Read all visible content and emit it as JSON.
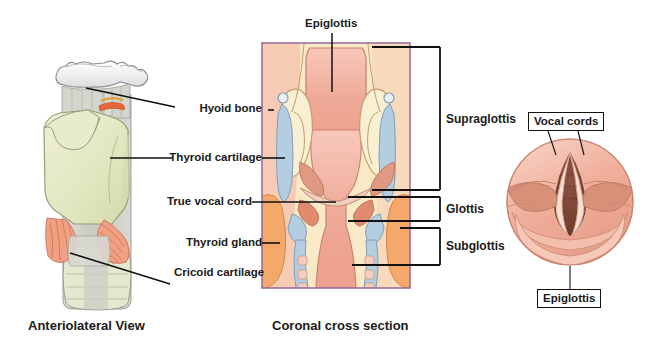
{
  "figure": {
    "title_top_label": "Epiglottis",
    "captions": {
      "left": "Anteriolateral View",
      "middle": "Coronal cross section"
    }
  },
  "anterolateral_view": {
    "labels": [
      {
        "text": "Hyoid bone"
      },
      {
        "text": "Thyroid cartilage"
      },
      {
        "text": "True vocal cord"
      },
      {
        "text": "Thyroid gland"
      },
      {
        "text": "Cricoid cartilage"
      }
    ]
  },
  "coronal_view": {
    "top_label": "Epiglottis",
    "region_labels": [
      {
        "text": "Supraglottis"
      },
      {
        "text": "Glottis"
      },
      {
        "text": "Subglottis"
      }
    ]
  },
  "laryngoscopic_view": {
    "boxed_labels": [
      {
        "text": "Vocal cords"
      },
      {
        "text": "Epiglottis"
      }
    ]
  },
  "colors": {
    "background": "#ffffff",
    "leader_line": "#111111",
    "panel_border": "#9c6f9c",
    "hyoid_bone": "#f2f2f0",
    "thyroid_cartilage": "#e4e7c4",
    "membrane_grey": "#cfcfc9",
    "muscle_orange": "#ef9a78",
    "mucosa_pink": "#f0ab9b",
    "mucosa_light": "#f6c3b5",
    "cartilage_blue": "#b4cde0",
    "fat_cream": "#f8e7c0",
    "thyroid_gland": "#f4a96a",
    "glottic_opening": "#7a4436",
    "text": "#1a1a1a"
  }
}
